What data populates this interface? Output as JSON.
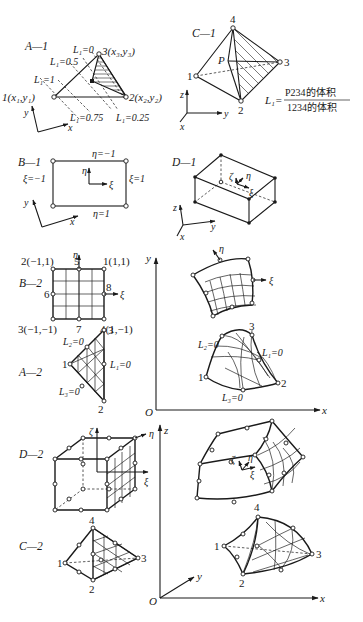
{
  "figure": {
    "panels": {
      "A1": {
        "tag": "A—1",
        "node1": "1(x₁,y₁)",
        "node2": "2(x₂,y₂)",
        "node3": "3(x₃,y₃)",
        "iso": [
          "L₁=0",
          "L₁=0.5",
          "L₁=1",
          "L₁=0.75",
          "L₁=0.25"
        ],
        "axis_x": "x",
        "axis_y": "y"
      },
      "C1": {
        "tag": "C—1",
        "n1": "1",
        "n2": "2",
        "n3": "3",
        "n4": "4",
        "p": "P",
        "formula_lhs": "L₁=",
        "formula_num": "P234的体积",
        "formula_den": "1234的体积",
        "axis_x": "x",
        "axis_y": "y",
        "axis_z": "z"
      },
      "B1": {
        "tag": "B—1",
        "top": "η=−1",
        "bottom": "η=1",
        "left": "ξ=−1",
        "right": "ξ=1",
        "eta": "η",
        "xi": "ξ",
        "axis_x": "x",
        "axis_y": "y"
      },
      "D1": {
        "tag": "D—1",
        "zeta": "ζ",
        "eta": "η",
        "xi": "ξ",
        "axis_x": "x",
        "axis_y": "y",
        "axis_z": "z"
      },
      "B2": {
        "tag": "B—2",
        "n1": "1(1,1)",
        "n2": "2(−1,1)",
        "n3": "3(−1,−1)",
        "n4": "4(1,−1)",
        "n5": "5",
        "n6": "6",
        "n7": "7",
        "n8": "8",
        "eta": "η",
        "xi": "ξ"
      },
      "A2": {
        "tag": "A—2",
        "n1": "1",
        "n2": "2",
        "n3": "3",
        "l2": "L₂=0",
        "l1": "L₁=0",
        "l3": "L₃=0"
      },
      "mapped2D": {
        "eta": "η",
        "xi": "ξ",
        "n1": "1",
        "n2": "2",
        "n3": "3",
        "l2": "L₂=0",
        "l1": "L₁=0",
        "l3": "L₃=0",
        "origin": "O",
        "axis_x": "x",
        "axis_y": "y"
      },
      "D2": {
        "tag": "D—2",
        "zeta": "ζ",
        "eta": "η",
        "xi": "ξ"
      },
      "C2": {
        "tag": "C—2",
        "n1": "1",
        "n2": "2",
        "n3": "3",
        "n4": "4"
      },
      "mapped3D": {
        "zeta": "ζ",
        "eta": "η",
        "xi": "ξ",
        "n1": "1",
        "n2": "2",
        "n3": "3",
        "n4": "4",
        "origin": "O",
        "axis_x": "x",
        "axis_y": "y",
        "axis_z": "z"
      }
    }
  }
}
